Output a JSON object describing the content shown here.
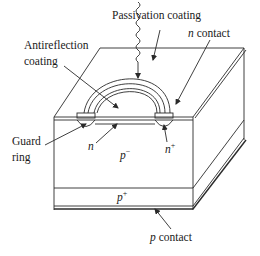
{
  "diagram": {
    "type": "device cross-section (avalanche photodiode)",
    "labels": {
      "passivation": "Passivation coating",
      "antireflection_1": "Antireflection",
      "antireflection_2": "coating",
      "n_contact_n": "n",
      "n_contact_rest": " contact",
      "guard_1": "Guard",
      "guard_2": "ring",
      "n_region": "n",
      "p_minus_p": "p",
      "p_minus_sup": "−",
      "n_plus_n": "n",
      "n_plus_sup": "+",
      "p_plus_p": "p",
      "p_plus_sup": "+",
      "p_contact_p": "p",
      "p_contact_rest": " contact"
    },
    "colors": {
      "stroke": "#2a2a2a",
      "text": "#1a1a1a",
      "background": "#ffffff"
    }
  }
}
